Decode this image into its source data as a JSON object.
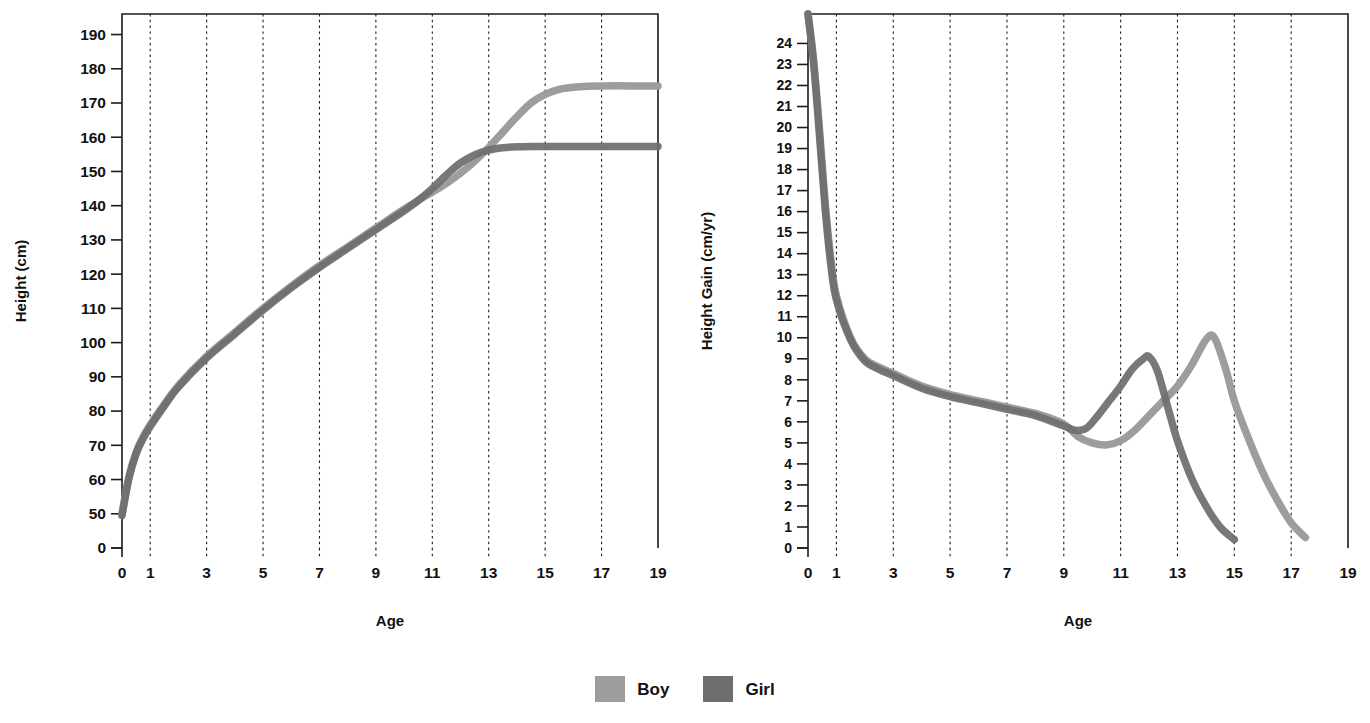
{
  "legend": {
    "items": [
      {
        "label": "Boy",
        "color": "#9d9d9d",
        "key": "boy"
      },
      {
        "label": "Girl",
        "color": "#6e6e6e",
        "key": "girl"
      }
    ]
  },
  "chart_data": [
    {
      "id": "height-for-age",
      "type": "line",
      "title": "",
      "xlabel": "Age",
      "ylabel": "Height (cm)",
      "xlim": [
        0,
        19
      ],
      "ylim": [
        40,
        196
      ],
      "grid": "vertical-dotted",
      "legend_position": "bottom-center",
      "xticks": [
        0,
        1,
        3,
        5,
        7,
        9,
        11,
        13,
        15,
        17,
        19
      ],
      "xticklabels": [
        "0",
        "1",
        "3",
        "5",
        "7",
        "9",
        "11",
        "13",
        "15",
        "17",
        "19"
      ],
      "yticks": [
        40,
        50,
        60,
        70,
        80,
        90,
        100,
        110,
        120,
        130,
        140,
        150,
        160,
        170,
        180,
        190
      ],
      "yticklabels": [
        "0",
        "50",
        "60",
        "70",
        "80",
        "90",
        "100",
        "110",
        "120",
        "130",
        "140",
        "150",
        "160",
        "170",
        "180",
        "190"
      ],
      "axis_break_below": 50,
      "series": [
        {
          "name": "Boy",
          "color": "#9d9d9d",
          "x": [
            0,
            0.25,
            0.5,
            0.75,
            1,
            1.5,
            2,
            3,
            4,
            5,
            6,
            7,
            8,
            9,
            10,
            11,
            11.5,
            12,
            12.5,
            13,
            13.5,
            14,
            14.5,
            15,
            15.5,
            16,
            16.5,
            17,
            18,
            19
          ],
          "y": [
            50,
            61,
            68,
            72.5,
            76,
            82,
            87.5,
            96,
            103,
            110,
            116.5,
            122.5,
            128,
            133.5,
            139,
            144,
            146.5,
            149.5,
            153,
            157,
            161.5,
            166,
            170,
            172.5,
            174,
            174.6,
            174.9,
            175,
            175,
            175
          ]
        },
        {
          "name": "Girl",
          "color": "#6e6e6e",
          "x": [
            0,
            0.25,
            0.5,
            0.75,
            1,
            1.5,
            2,
            3,
            4,
            5,
            6,
            7,
            8,
            9,
            10,
            10.5,
            11,
            11.5,
            12,
            12.5,
            13,
            13.5,
            14,
            14.5,
            15,
            16,
            17,
            18,
            19
          ],
          "y": [
            49.5,
            60.5,
            67.5,
            72,
            75.5,
            81.5,
            87,
            95.5,
            102.5,
            109.5,
            116,
            122,
            127.5,
            133,
            138.5,
            141.5,
            145,
            149,
            152.5,
            154.8,
            156.2,
            156.9,
            157.2,
            157.3,
            157.3,
            157.3,
            157.3,
            157.3,
            157.3
          ]
        }
      ]
    },
    {
      "id": "height-velocity",
      "type": "line",
      "title": "",
      "xlabel": "Age",
      "ylabel": "Height Gain (cm/yr)",
      "xlim": [
        0,
        19
      ],
      "ylim": [
        0,
        25.4
      ],
      "grid": "vertical-dotted",
      "legend_position": "bottom-center",
      "xticks": [
        0,
        1,
        3,
        5,
        7,
        9,
        11,
        13,
        15,
        17,
        19
      ],
      "xticklabels": [
        "0",
        "1",
        "3",
        "5",
        "7",
        "9",
        "11",
        "13",
        "15",
        "17",
        "19"
      ],
      "yticks": [
        0,
        1,
        2,
        3,
        4,
        5,
        6,
        7,
        8,
        9,
        10,
        11,
        12,
        13,
        14,
        15,
        16,
        17,
        18,
        19,
        20,
        21,
        22,
        23,
        24
      ],
      "yticklabels": [
        "0",
        "1",
        "2",
        "3",
        "4",
        "5",
        "6",
        "7",
        "8",
        "9",
        "10",
        "11",
        "12",
        "13",
        "14",
        "15",
        "16",
        "17",
        "18",
        "19",
        "20",
        "21",
        "22",
        "23",
        "24"
      ],
      "series": [
        {
          "name": "Boy",
          "color": "#9d9d9d",
          "x": [
            0,
            0.2,
            0.4,
            0.6,
            0.8,
            1,
            1.5,
            2,
            2.5,
            3,
            4,
            5,
            6,
            7,
            8,
            9,
            9.5,
            10,
            10.5,
            11,
            11.5,
            12,
            12.5,
            13,
            13.5,
            14,
            14.3,
            14.7,
            15,
            15.5,
            16,
            16.5,
            17,
            17.5
          ],
          "y": [
            25.4,
            23.2,
            20.0,
            16.5,
            13.8,
            12.0,
            10.0,
            9.0,
            8.6,
            8.3,
            7.7,
            7.3,
            7.0,
            6.7,
            6.4,
            5.9,
            5.3,
            5.0,
            4.9,
            5.1,
            5.6,
            6.3,
            7.0,
            7.7,
            8.7,
            9.9,
            10.0,
            8.5,
            7.0,
            5.2,
            3.6,
            2.3,
            1.2,
            0.5
          ]
        },
        {
          "name": "Girl",
          "color": "#6e6e6e",
          "x": [
            0,
            0.2,
            0.4,
            0.6,
            0.8,
            1,
            1.5,
            2,
            2.5,
            3,
            4,
            5,
            6,
            7,
            8,
            9,
            9.4,
            9.8,
            10.2,
            10.6,
            11,
            11.4,
            11.8,
            12,
            12.3,
            12.7,
            13,
            13.5,
            14,
            14.5,
            15
          ],
          "y": [
            25.4,
            23.0,
            19.7,
            16.2,
            13.5,
            11.8,
            9.9,
            8.9,
            8.5,
            8.2,
            7.6,
            7.2,
            6.9,
            6.6,
            6.3,
            5.8,
            5.6,
            5.7,
            6.3,
            7.0,
            7.7,
            8.5,
            9.0,
            9.1,
            8.4,
            6.5,
            5.1,
            3.3,
            2.0,
            1.0,
            0.4
          ]
        }
      ]
    }
  ]
}
